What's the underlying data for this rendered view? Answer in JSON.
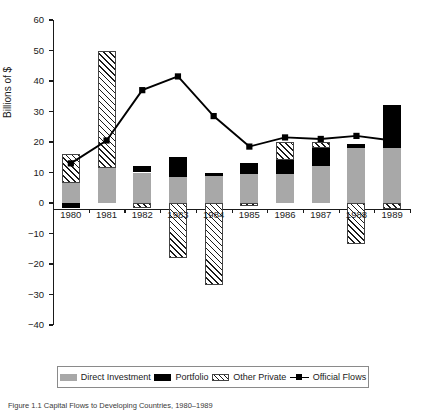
{
  "chart_data": {
    "type": "bar",
    "title": "",
    "xlabel": "",
    "ylabel": "Billions of $",
    "ylim": [
      -40,
      60
    ],
    "yticks": [
      60,
      50,
      40,
      30,
      20,
      10,
      0,
      -10,
      -20,
      -30,
      -40
    ],
    "ytick_labels": [
      "60",
      "50",
      "40",
      "30",
      "20",
      "10",
      "0",
      "−10",
      "−20",
      "−30",
      "−40"
    ],
    "grid": false,
    "legend_position": "bottom",
    "stacked": true,
    "categories": [
      "1980",
      "1981",
      "1982",
      "1983",
      "1984",
      "1985",
      "1986",
      "1987",
      "1988",
      "1989"
    ],
    "series": [
      {
        "name": "Direct Investment",
        "type": "bar",
        "color": "#a8a8a8",
        "values": [
          6.5,
          11.5,
          10.0,
          8.5,
          9.0,
          9.5,
          9.5,
          12.0,
          18.0,
          18.0
        ]
      },
      {
        "name": "Portfolio",
        "type": "bar",
        "color": "#000000",
        "values": [
          -1.5,
          0.0,
          2.0,
          6.5,
          1.0,
          3.5,
          4.5,
          6.0,
          1.5,
          14.0
        ]
      },
      {
        "name": "Other Private",
        "type": "bar",
        "color": "hatched",
        "values": [
          9.5,
          38.5,
          -1.5,
          -18.0,
          -27.0,
          -1.0,
          6.0,
          2.0,
          -13.5,
          -2.0
        ]
      },
      {
        "name": "Official Flows",
        "type": "line",
        "color": "#000000",
        "marker": "square",
        "values": [
          13.0,
          20.5,
          37.0,
          41.5,
          28.5,
          18.5,
          21.5,
          21.0,
          22.0,
          20.5
        ]
      }
    ]
  },
  "legend": {
    "items": [
      {
        "label": "Direct Investment",
        "swatch": "direct-investment-swatch"
      },
      {
        "label": "Portfolio",
        "swatch": "portfolio-swatch"
      },
      {
        "label": "Other Private",
        "swatch": "other-private-swatch"
      },
      {
        "label": "Official Flows",
        "swatch": "official-flows-swatch"
      }
    ]
  },
  "caption": {
    "text": "Figure 1.1 Capital Flows to Developing Countries, 1980–1989"
  }
}
